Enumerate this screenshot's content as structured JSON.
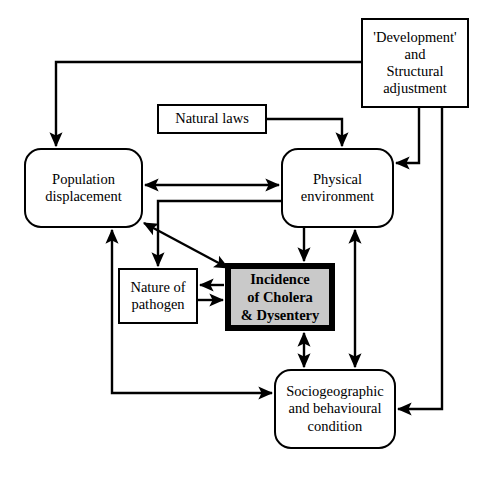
{
  "diagram": {
    "type": "flowchart",
    "canvas": {
      "width": 489,
      "height": 484,
      "background": "#ffffff"
    },
    "colors": {
      "stroke": "#000000",
      "node_fill": "#ffffff",
      "emphasis_fill": "#c9c9c9",
      "emphasis_border": "#000000",
      "text": "#000000"
    },
    "nodes": [
      {
        "id": "development",
        "label": "'Development'\nand\nStructural\nadjustment",
        "shape": "rect",
        "x": 361,
        "y": 18,
        "w": 108,
        "h": 90
      },
      {
        "id": "natural_laws",
        "label": "Natural laws",
        "shape": "rect",
        "x": 157,
        "y": 104,
        "w": 110,
        "h": 30
      },
      {
        "id": "population_displacement",
        "label": "Population\ndisplacement",
        "shape": "rounded",
        "x": 24,
        "y": 148,
        "w": 119,
        "h": 80
      },
      {
        "id": "physical_environment",
        "label": "Physical\nenvironment",
        "shape": "rounded",
        "x": 281,
        "y": 148,
        "w": 113,
        "h": 80
      },
      {
        "id": "nature_of_pathogen",
        "label": "Nature of\npathogen",
        "shape": "rect",
        "x": 118,
        "y": 268,
        "w": 80,
        "h": 56
      },
      {
        "id": "incidence",
        "label": "Incidence\nof Cholera\n& Dysentery",
        "shape": "emphasis",
        "x": 225,
        "y": 263,
        "w": 110,
        "h": 68
      },
      {
        "id": "sociogeographic",
        "label": "Sociogeographic\nand behavioural\ncondition",
        "shape": "rounded",
        "x": 274,
        "y": 369,
        "w": 122,
        "h": 80
      }
    ],
    "edges": [
      {
        "id": "development-to-population",
        "from": "development",
        "to": "population_displacement",
        "arrows": "single",
        "route": "elbow-left-down"
      },
      {
        "id": "development-to-physical",
        "from": "development",
        "to": "physical_environment",
        "arrows": "single",
        "route": "down-left"
      },
      {
        "id": "development-to-sociogeographic",
        "from": "development",
        "to": "sociogeographic",
        "arrows": "single",
        "route": "down-left"
      },
      {
        "id": "natural-laws-to-physical",
        "from": "natural_laws",
        "to": "physical_environment",
        "arrows": "single",
        "route": "right-down"
      },
      {
        "id": "population-physical",
        "from": "population_displacement",
        "to": "physical_environment",
        "arrows": "double",
        "route": "horizontal"
      },
      {
        "id": "physical-to-pathogen",
        "from": "physical_environment",
        "to": "nature_of_pathogen",
        "arrows": "single",
        "route": "left-down"
      },
      {
        "id": "population-incidence",
        "from": "population_displacement",
        "to": "incidence",
        "arrows": "double",
        "route": "diagonal"
      },
      {
        "id": "pathogen-from-incidence",
        "from": "incidence",
        "to": "nature_of_pathogen",
        "arrows": "single",
        "route": "horizontal"
      },
      {
        "id": "pathogen-to-incidence",
        "from": "nature_of_pathogen",
        "to": "incidence",
        "arrows": "single",
        "route": "horizontal"
      },
      {
        "id": "physical-to-incidence",
        "from": "physical_environment",
        "to": "incidence",
        "arrows": "single",
        "route": "vertical"
      },
      {
        "id": "incidence-sociogeographic",
        "from": "incidence",
        "to": "sociogeographic",
        "arrows": "double",
        "route": "vertical"
      },
      {
        "id": "physical-sociogeographic",
        "from": "physical_environment",
        "to": "sociogeographic",
        "arrows": "double",
        "route": "vertical"
      },
      {
        "id": "population-sociogeographic",
        "from": "population_displacement",
        "to": "sociogeographic",
        "arrows": "double",
        "route": "elbow-down-right"
      }
    ]
  }
}
